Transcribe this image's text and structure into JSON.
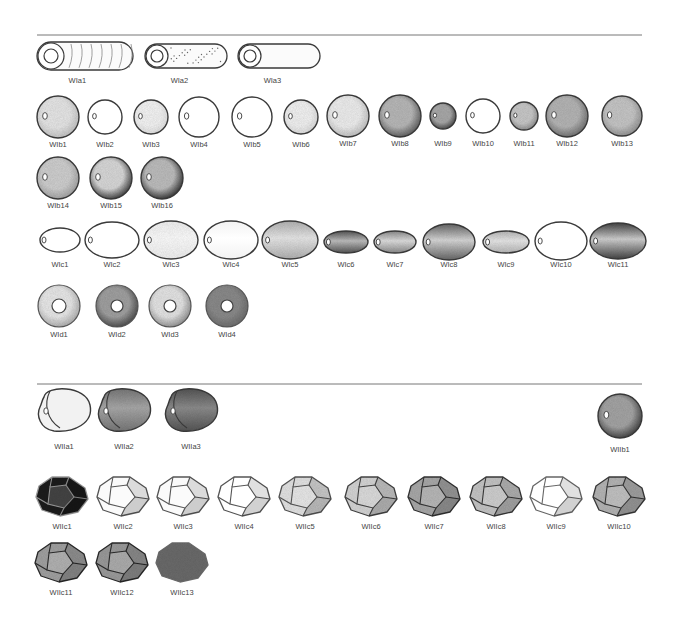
{
  "sections": [
    {
      "id": "W",
      "rule_y": 35,
      "groups": [
        {
          "id": "Wia",
          "shape": "cylinder",
          "items": [
            {
              "label": "WIa1",
              "x": 85,
              "y": 56,
              "w": 96,
              "h": 28,
              "texture": "streaks"
            },
            {
              "label": "WIa2",
              "x": 186,
              "y": 56,
              "w": 82,
              "h": 24,
              "texture": "dots"
            },
            {
              "label": "WIa3",
              "x": 279,
              "y": 56,
              "w": 82,
              "h": 24,
              "texture": "plain"
            }
          ],
          "label_y": 83
        },
        {
          "id": "Wib",
          "shape": "sphere",
          "items": [
            {
              "label": "WIb1",
              "x": 58,
              "y": 117,
              "r": 21,
              "fill": "#e6e6e6",
              "shade": "#bdbdbd"
            },
            {
              "label": "WIb2",
              "x": 105,
              "y": 117,
              "r": 17,
              "fill": "#ffffff",
              "shade": "#ffffff"
            },
            {
              "label": "WIb3",
              "x": 151,
              "y": 117,
              "r": 17,
              "fill": "#f4f4f4",
              "shade": "#dddddd"
            },
            {
              "label": "WIb4",
              "x": 199,
              "y": 117,
              "r": 20,
              "fill": "#ffffff",
              "shade": "#ffffff"
            },
            {
              "label": "WIb5",
              "x": 252,
              "y": 117,
              "r": 20,
              "fill": "#ffffff",
              "shade": "#ffffff"
            },
            {
              "label": "WIb6",
              "x": 301,
              "y": 117,
              "r": 17,
              "fill": "#f2f2f2",
              "shade": "#d8d8d8"
            },
            {
              "label": "WIb7",
              "x": 348,
              "y": 116,
              "r": 21,
              "fill": "#eeeeee",
              "shade": "#bbbbbb"
            },
            {
              "label": "WIb8",
              "x": 400,
              "y": 116,
              "r": 21,
              "fill": "#b8b8b8",
              "shade": "#555555"
            },
            {
              "label": "WIb9",
              "x": 443,
              "y": 116,
              "r": 13,
              "fill": "#a8a8a8",
              "shade": "#444444"
            },
            {
              "label": "WIb10",
              "x": 483,
              "y": 116,
              "r": 17,
              "fill": "#ffffff",
              "shade": "#ffffff"
            },
            {
              "label": "WIb11",
              "x": 524,
              "y": 116,
              "r": 14,
              "fill": "#c8c8c8",
              "shade": "#8a8a8a"
            },
            {
              "label": "WIb12",
              "x": 567,
              "y": 116,
              "r": 21,
              "fill": "#b5b5b5",
              "shade": "#6a6a6a"
            },
            {
              "label": "WIb13",
              "x": 622,
              "y": 116,
              "r": 20,
              "fill": "#c6c6c6",
              "shade": "#8c8c8c"
            },
            {
              "label": "WIb14",
              "x": 58,
              "y": 178,
              "r": 21,
              "fill": "#cfcfcf",
              "shade": "#9c9c9c"
            },
            {
              "label": "WIb15",
              "x": 111,
              "y": 178,
              "r": 21,
              "fill": "#d8d8d8",
              "shade": "#333333"
            },
            {
              "label": "WIb16",
              "x": 162,
              "y": 178,
              "r": 21,
              "fill": "#bdbdbd",
              "shade": "#2a2a2a"
            }
          ]
        },
        {
          "id": "Wic",
          "shape": "ellipsoid",
          "items": [
            {
              "label": "WIc1",
              "x": 60,
              "y": 240,
              "rx": 20,
              "ry": 12,
              "fill": "#ffffff",
              "shade": "#ffffff"
            },
            {
              "label": "WIc2",
              "x": 112,
              "y": 240,
              "rx": 27,
              "ry": 18,
              "fill": "#ffffff",
              "shade": "#ffffff"
            },
            {
              "label": "WIc3",
              "x": 171,
              "y": 240,
              "rx": 27,
              "ry": 19,
              "fill": "#fbfbfb",
              "shade": "#eeeeee"
            },
            {
              "label": "WIc4",
              "x": 231,
              "y": 240,
              "rx": 27,
              "ry": 19,
              "fill": "#ffffff",
              "shade": "#f2f2f2"
            },
            {
              "label": "WIc5",
              "x": 290,
              "y": 240,
              "rx": 28,
              "ry": 19,
              "fill": "#e6e6e6",
              "shade": "#b0b0b0"
            },
            {
              "label": "WIc6",
              "x": 346,
              "y": 242,
              "rx": 22,
              "ry": 11,
              "fill": "#bdbdbd",
              "shade": "#555555"
            },
            {
              "label": "WIc7",
              "x": 395,
              "y": 242,
              "rx": 21,
              "ry": 11,
              "fill": "#dddddd",
              "shade": "#8a8a8a"
            },
            {
              "label": "WIc8",
              "x": 449,
              "y": 242,
              "rx": 26,
              "ry": 18,
              "fill": "#d6d6d6",
              "shade": "#666666"
            },
            {
              "label": "WIc9",
              "x": 506,
              "y": 242,
              "rx": 23,
              "ry": 11,
              "fill": "#e6e6e6",
              "shade": "#b5b5b5"
            },
            {
              "label": "WIc10",
              "x": 561,
              "y": 241,
              "rx": 26,
              "ry": 19,
              "fill": "#ffffff",
              "shade": "#ffffff"
            },
            {
              "label": "WIc11",
              "x": 618,
              "y": 241,
              "rx": 28,
              "ry": 18,
              "fill": "#cfcfcf",
              "shade": "#444444"
            }
          ]
        },
        {
          "id": "Wid",
          "shape": "disc-bead",
          "items": [
            {
              "label": "WId1",
              "x": 59,
              "y": 306,
              "r": 21,
              "hole": 7,
              "fill": "#e8e8e8",
              "shade": "#a8a8a8"
            },
            {
              "label": "WId2",
              "x": 117,
              "y": 306,
              "r": 21,
              "hole": 6,
              "fill": "#a0a0a0",
              "shade": "#444444"
            },
            {
              "label": "WId3",
              "x": 170,
              "y": 306,
              "r": 21,
              "hole": 6,
              "fill": "#e4e4e4",
              "shade": "#8a8a8a"
            },
            {
              "label": "WId4",
              "x": 227,
              "y": 306,
              "r": 21,
              "hole": 6,
              "fill": "#8a8a8a",
              "shade": "#6a6a6a"
            }
          ]
        }
      ]
    },
    {
      "id": "WII",
      "rule_y": 384,
      "groups": [
        {
          "id": "WIIa",
          "shape": "kidney",
          "items": [
            {
              "label": "WIIa1",
              "x": 64,
              "y": 409,
              "fill": "#f2f2f2",
              "shade": "#f2f2f2"
            },
            {
              "label": "WIIa2",
              "x": 124,
              "y": 409,
              "fill": "#a8a8a8",
              "shade": "#777777"
            },
            {
              "label": "WIIa3",
              "x": 191,
              "y": 409,
              "fill": "#8c8c8c",
              "shade": "#555555"
            }
          ],
          "label_y": 449
        },
        {
          "id": "WIIb",
          "shape": "sphere",
          "items": [
            {
              "label": "WIIb1",
              "x": 620,
              "y": 416,
              "r": 22,
              "fill": "#a4a4a4",
              "shade": "#3a3a3a"
            }
          ],
          "label_y": 452
        },
        {
          "id": "WIIc",
          "shape": "faceted",
          "items": [
            {
              "label": "WIIc1",
              "x": 62,
              "y": 496,
              "fill": "#1c1c1c",
              "edge": "#9a9a9a"
            },
            {
              "label": "WIIc2",
              "x": 123,
              "y": 496,
              "fill": "#fafafa",
              "edge": "#555555"
            },
            {
              "label": "WIIc3",
              "x": 183,
              "y": 496,
              "fill": "#fafafa",
              "edge": "#555555"
            },
            {
              "label": "WIIc4",
              "x": 244,
              "y": 496,
              "fill": "#ffffff",
              "edge": "#555555"
            },
            {
              "label": "WIIc5",
              "x": 305,
              "y": 496,
              "fill": "#e2e2e2",
              "edge": "#555555"
            },
            {
              "label": "WIIc6",
              "x": 371,
              "y": 496,
              "fill": "#d4d4d4",
              "edge": "#444444"
            },
            {
              "label": "WIIc7",
              "x": 434,
              "y": 496,
              "fill": "#a8a8a8",
              "edge": "#333333"
            },
            {
              "label": "WIIc8",
              "x": 496,
              "y": 496,
              "fill": "#c4c4c4",
              "edge": "#3a3a3a"
            },
            {
              "label": "WIIc9",
              "x": 556,
              "y": 496,
              "fill": "#ffffff",
              "edge": "#666666"
            },
            {
              "label": "WIIc10",
              "x": 619,
              "y": 496,
              "fill": "#b4b4b4",
              "edge": "#3a3a3a"
            },
            {
              "label": "WIIc11",
              "x": 61,
              "y": 562,
              "fill": "#a0a0a0",
              "edge": "#2a2a2a"
            },
            {
              "label": "WIIc12",
              "x": 122,
              "y": 562,
              "fill": "#9a9a9a",
              "edge": "#2a2a2a"
            },
            {
              "label": "WIIc13",
              "x": 182,
              "y": 562,
              "fill": "#6a6a6a",
              "edge": "#6a6a6a",
              "plain": true
            }
          ]
        }
      ]
    }
  ]
}
